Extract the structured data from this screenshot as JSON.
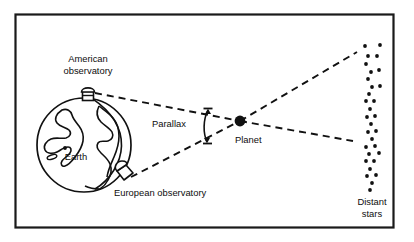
{
  "figure": {
    "frame_color": "#1a1a1a",
    "line_color": "#111111",
    "background": "#ffffff"
  },
  "labels": {
    "american_observatory_line1": "American",
    "american_observatory_line2": "observatory",
    "earth": "Earth",
    "european_observatory": "European observatory",
    "parallax": "Parallax",
    "planet": "Planet",
    "distant_stars_line1": "Distant",
    "distant_stars_line2": "stars"
  },
  "geometry": {
    "frame": {
      "x": 15,
      "y": 14,
      "width": 379,
      "height": 214
    },
    "earth_globe": {
      "cx": 84,
      "cy": 145,
      "r": 47
    },
    "planet_dot": {
      "cx": 240,
      "cy": 121,
      "r": 5.2
    },
    "american_observatory_point": {
      "x": 95,
      "y": 94
    },
    "european_observatory_point": {
      "x": 130,
      "y": 178
    },
    "sightline_upper_end": {
      "x": 357,
      "y": 52
    },
    "sightline_lower_end": {
      "x": 353,
      "y": 141
    },
    "parallax_arc": {
      "x": 207,
      "y_top": 108,
      "y_bottom": 144
    }
  },
  "stars": [
    {
      "x": 365,
      "y": 46
    },
    {
      "x": 380,
      "y": 45
    },
    {
      "x": 368,
      "y": 56
    },
    {
      "x": 377,
      "y": 56
    },
    {
      "x": 366,
      "y": 64
    },
    {
      "x": 371,
      "y": 72
    },
    {
      "x": 379,
      "y": 70
    },
    {
      "x": 368,
      "y": 79
    },
    {
      "x": 372,
      "y": 87
    },
    {
      "x": 380,
      "y": 86
    },
    {
      "x": 369,
      "y": 94
    },
    {
      "x": 366,
      "y": 101
    },
    {
      "x": 374,
      "y": 101
    },
    {
      "x": 370,
      "y": 109
    },
    {
      "x": 367,
      "y": 117
    },
    {
      "x": 375,
      "y": 116
    },
    {
      "x": 371,
      "y": 124
    },
    {
      "x": 368,
      "y": 132
    },
    {
      "x": 376,
      "y": 131
    },
    {
      "x": 372,
      "y": 139
    },
    {
      "x": 366,
      "y": 147
    },
    {
      "x": 375,
      "y": 146
    },
    {
      "x": 369,
      "y": 154
    },
    {
      "x": 379,
      "y": 153
    },
    {
      "x": 366,
      "y": 161
    },
    {
      "x": 374,
      "y": 161
    },
    {
      "x": 370,
      "y": 169
    },
    {
      "x": 367,
      "y": 176
    },
    {
      "x": 376,
      "y": 175
    },
    {
      "x": 372,
      "y": 183
    },
    {
      "x": 370,
      "y": 190
    }
  ],
  "star_radius": 1.9
}
